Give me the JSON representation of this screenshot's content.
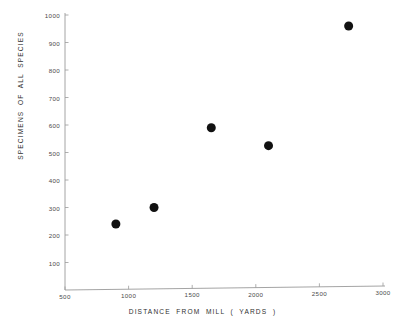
{
  "chart_data": {
    "type": "scatter",
    "title": "",
    "xlabel": "DISTANCE  FROM  MILL  ( YARDS )",
    "ylabel": "SPECIMENS  OF  ALL  SPECIES",
    "xlim": [
      500,
      3000
    ],
    "ylim": [
      0,
      1000
    ],
    "grid": false,
    "legend": null,
    "xticks": [
      500,
      1000,
      1500,
      2000,
      2500,
      3000
    ],
    "xticklabels": [
      "500",
      "1000",
      "1500",
      "2000",
      "2500",
      "3000"
    ],
    "yticks": [
      100,
      200,
      300,
      400,
      500,
      600,
      700,
      800,
      900,
      1000
    ],
    "yticklabels": [
      "100",
      "200",
      "300",
      "400",
      "500",
      "600",
      "700",
      "800",
      "900",
      "1000"
    ],
    "marker": "filled-circle",
    "marker_color": "#111111",
    "marker_size_px": 9,
    "points": [
      {
        "x": 900,
        "y": 240
      },
      {
        "x": 1200,
        "y": 300
      },
      {
        "x": 1650,
        "y": 590
      },
      {
        "x": 2100,
        "y": 525
      },
      {
        "x": 2730,
        "y": 960
      }
    ],
    "series": [
      {
        "name": "Specimens of all species",
        "x": [
          900,
          1200,
          1650,
          2100,
          2730
        ],
        "values": [
          240,
          300,
          590,
          525,
          960
        ]
      }
    ]
  },
  "axes": {
    "x_axis_name": "distance-from-mill-axis",
    "y_axis_name": "specimens-axis"
  }
}
